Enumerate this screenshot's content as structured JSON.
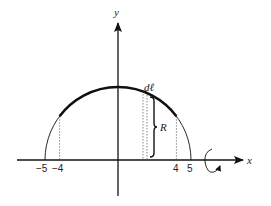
{
  "diagram": {
    "type": "semicircle-surface-of-revolution",
    "axes": {
      "x_label": "x",
      "y_label": "y"
    },
    "circle": {
      "radius": 5,
      "highlighted_arc_x_range": [
        -4,
        4
      ]
    },
    "tick_labels": {
      "neg5": "−5",
      "neg4": "−4",
      "pos4": "4",
      "pos5": "5"
    },
    "element_label": "dℓ",
    "radius_label": "R",
    "rotation_axis": "x"
  }
}
